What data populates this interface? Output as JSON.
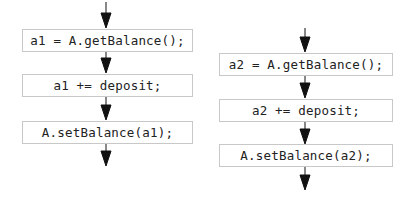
{
  "flows": [
    {
      "name": "thread-1",
      "statements": [
        {
          "text": "a1 = A.getBalance();"
        },
        {
          "text": "a1 += deposit;"
        },
        {
          "text": "A.setBalance(a1);"
        }
      ]
    },
    {
      "name": "thread-2",
      "statements": [
        {
          "text": "a2 = A.getBalance();"
        },
        {
          "text": "a2 += deposit;"
        },
        {
          "text": "A.setBalance(a2);"
        }
      ]
    }
  ],
  "colors": {
    "box_border": "#c8c8c8",
    "arrow": "#111111",
    "text": "#222222"
  }
}
